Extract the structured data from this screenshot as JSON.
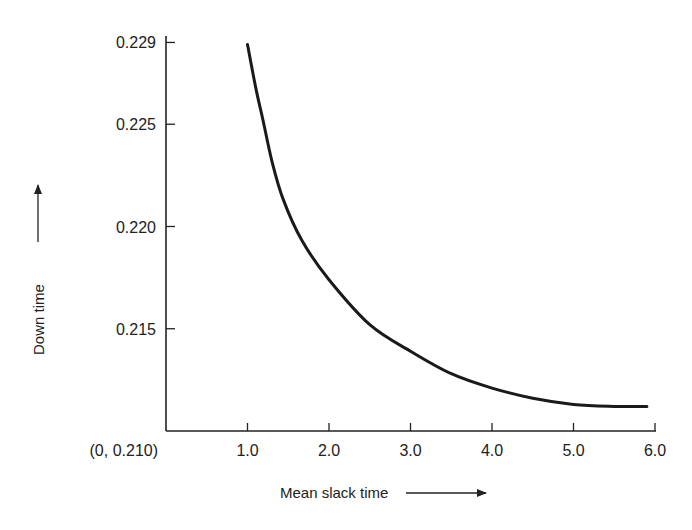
{
  "chart_data": {
    "type": "line",
    "title": "",
    "xlabel": "Mean slack time",
    "ylabel": "Down time",
    "origin_label": "(0, 0.210)",
    "x_ticks": [
      "1.0",
      "2.0",
      "3.0",
      "4.0",
      "5.0",
      "6.0"
    ],
    "x_tick_values": [
      1.0,
      2.0,
      3.0,
      4.0,
      5.0,
      6.0
    ],
    "y_ticks": [
      "0.215",
      "0.220",
      "0.225",
      "0.229"
    ],
    "y_tick_values": [
      0.215,
      0.22,
      0.225,
      0.229
    ],
    "xlim": [
      0,
      6.0
    ],
    "ylim": [
      0.21,
      0.229
    ],
    "grid": false,
    "legend": null,
    "series": [
      {
        "name": "Down time vs mean slack time",
        "x": [
          1.0,
          1.1,
          1.19,
          1.3,
          1.44,
          1.67,
          2.0,
          2.5,
          3.0,
          3.5,
          4.0,
          4.5,
          5.0,
          5.5,
          5.9
        ],
        "y": [
          0.2289,
          0.2268,
          0.2252,
          0.2232,
          0.2213,
          0.2193,
          0.2174,
          0.2152,
          0.2139,
          0.2128,
          0.2121,
          0.2116,
          0.2113,
          0.2112,
          0.2112
        ]
      }
    ]
  }
}
